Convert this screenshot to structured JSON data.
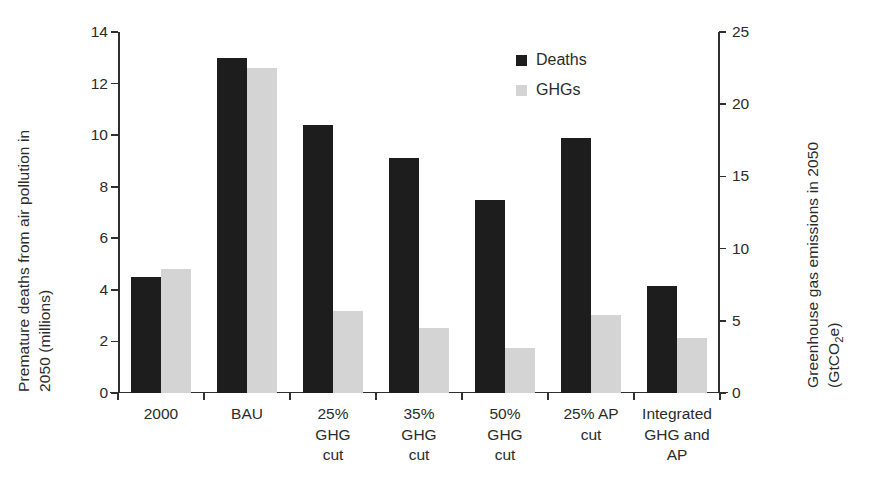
{
  "chart_data": {
    "type": "bar",
    "title": "",
    "categories": [
      "2000",
      "BAU",
      "25% GHG cut",
      "35% GHG cut",
      "50% GHG cut",
      "25% AP cut",
      "Integrated GHG and AP"
    ],
    "category_label_lines": [
      [
        "2000"
      ],
      [
        "BAU"
      ],
      [
        "25%",
        "GHG",
        "cut"
      ],
      [
        "35%",
        "GHG",
        "cut"
      ],
      [
        "50%",
        "GHG",
        "cut"
      ],
      [
        "25% AP",
        "cut"
      ],
      [
        "Integrated",
        "GHG and",
        "AP"
      ]
    ],
    "series": [
      {
        "name": "Deaths",
        "axis": "left",
        "color": "#1d1d1d",
        "values": [
          4.5,
          13.0,
          10.4,
          9.1,
          7.5,
          9.9,
          4.15
        ]
      },
      {
        "name": "GHGs",
        "axis": "right",
        "color": "#d4d4d4",
        "values": [
          8.6,
          22.5,
          5.7,
          4.5,
          3.1,
          5.4,
          3.8
        ]
      }
    ],
    "legend": {
      "position": "top-right",
      "entries": [
        {
          "label": "Deaths",
          "color": "#1d1d1d"
        },
        {
          "label": "GHGs",
          "color": "#d4d4d4"
        }
      ]
    },
    "left_axis": {
      "label_lines": [
        "Premature deaths from air pollution in",
        "2050  (millions)"
      ],
      "ylim": [
        0,
        14
      ],
      "ticks": [
        0,
        2,
        4,
        6,
        8,
        10,
        12,
        14
      ],
      "tick_labels": [
        "0",
        "2",
        "4",
        "6",
        "8",
        "10",
        "12",
        "14"
      ]
    },
    "right_axis": {
      "label_lines": [
        "Greenhouse gas emissions in 2050",
        "(GtCO2e)"
      ],
      "label_line2_prefix": "(GtCO",
      "label_line2_sub": "2",
      "label_line2_suffix": "e)",
      "ylim": [
        0,
        25
      ],
      "ticks": [
        0,
        5,
        10,
        15,
        20,
        25
      ],
      "tick_labels": [
        "0",
        "5",
        "10",
        "15",
        "20",
        "25"
      ]
    },
    "grid": false,
    "xlabel": ""
  }
}
